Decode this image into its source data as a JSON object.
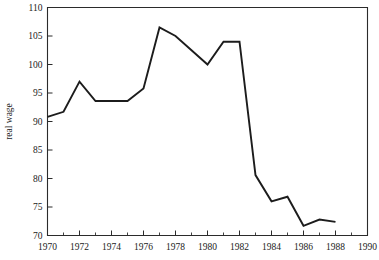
{
  "chart_data": {
    "type": "line",
    "title": "",
    "subtitle": "",
    "xlabel": "",
    "ylabel": "real wage",
    "xlim": [
      1970,
      1990
    ],
    "ylim": [
      70,
      110
    ],
    "grid": false,
    "legend": null,
    "legend_position": "none",
    "x_major_ticks": [
      1970,
      1972,
      1974,
      1976,
      1978,
      1980,
      1982,
      1984,
      1986,
      1988,
      1990
    ],
    "x_tick_labels": [
      "1970",
      "1972",
      "1974",
      "1976",
      "1978",
      "1980",
      "1982",
      "1984",
      "1986",
      "1988",
      "1990"
    ],
    "x_minor_ticks": [
      1971,
      1973,
      1975,
      1977,
      1979,
      1981,
      1983,
      1985,
      1987,
      1989
    ],
    "y_major_ticks": [
      70,
      75,
      80,
      85,
      90,
      95,
      100,
      105,
      110
    ],
    "y_tick_labels": [
      "70",
      "75",
      "80",
      "85",
      "90",
      "95",
      "100",
      "105",
      "110"
    ],
    "line_color": "#1c1c1c",
    "axis_color": "#2b2b2b",
    "x": [
      1970,
      1971,
      1972,
      1973,
      1974,
      1975,
      1976,
      1977,
      1978,
      1979,
      1980,
      1981,
      1982,
      1983,
      1984,
      1985,
      1986,
      1987,
      1988
    ],
    "values": [
      90.8,
      91.7,
      97.0,
      93.6,
      93.6,
      93.6,
      95.8,
      106.5,
      105.0,
      102.5,
      100.0,
      104.0,
      104.0,
      80.6,
      76.0,
      76.8,
      71.7,
      72.8,
      72.4
    ],
    "series": [
      {
        "name": "real wage",
        "values": [
          90.8,
          91.7,
          97.0,
          93.6,
          93.6,
          93.6,
          95.8,
          106.5,
          105.0,
          102.5,
          100.0,
          104.0,
          104.0,
          80.6,
          76.0,
          76.8,
          71.7,
          72.8,
          72.4
        ]
      }
    ],
    "annotations": []
  }
}
